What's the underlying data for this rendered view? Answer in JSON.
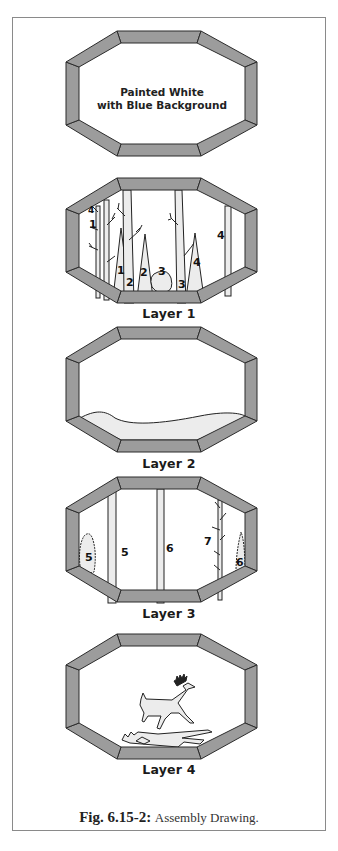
{
  "figure": {
    "caption_label": "Fig. 6.15-2:",
    "caption_text": "Assembly Drawing.",
    "colors": {
      "frame_fill": "#9c9c9c",
      "frame_stroke": "#2b2b2b",
      "piece_fill": "#e9e9e9",
      "background": "#ffffff"
    }
  },
  "panels": [
    {
      "id": "back",
      "label": "",
      "note_line1": "Painted White",
      "note_line2": "with Blue Background"
    },
    {
      "id": "layer1",
      "label": "Layer 1",
      "piece_numbers": [
        "1",
        "1",
        "2",
        "2",
        "3",
        "3",
        "4",
        "4",
        "4"
      ]
    },
    {
      "id": "layer2",
      "label": "Layer 2"
    },
    {
      "id": "layer3",
      "label": "Layer 3",
      "piece_numbers": [
        "5",
        "5",
        "6",
        "6",
        "7"
      ]
    },
    {
      "id": "layer4",
      "label": "Layer 4"
    }
  ]
}
